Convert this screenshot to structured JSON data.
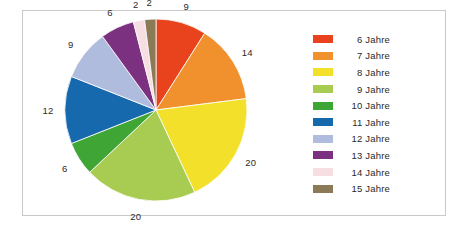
{
  "chart_data": {
    "type": "pie",
    "title": "",
    "subtitle": "",
    "xlabel": "",
    "ylabel": "",
    "legend_position": "right",
    "grid": false,
    "start_angle_deg": 0,
    "direction": "clockwise",
    "total": 100,
    "categories": [
      "6 Jahre",
      "7 Jahre",
      "8 Jahre",
      "9 Jahre",
      "10 Jahre",
      "11 Jahre",
      "12 Jahre",
      "13 Jahre",
      "14 Jahre",
      "15 Jahre"
    ],
    "values": [
      9,
      14,
      20,
      20,
      6,
      12,
      9,
      6,
      2,
      2
    ],
    "data_labels": [
      "9",
      "14",
      "20",
      "20",
      "6",
      "12",
      "9",
      "6",
      "2",
      "2"
    ],
    "colors": [
      "#E8431C",
      "#F0912E",
      "#F3E02A",
      "#A8CB52",
      "#3FA535",
      "#1769AD",
      "#AFBCDD",
      "#7B3180",
      "#F7DEE2",
      "#8B7A56"
    ]
  },
  "legend": {
    "items": [
      {
        "label": "6 Jahre",
        "color": "#E8431C"
      },
      {
        "label": "7 Jahre",
        "color": "#F0912E"
      },
      {
        "label": "8 Jahre",
        "color": "#F3E02A"
      },
      {
        "label": "9 Jahre",
        "color": "#A8CB52"
      },
      {
        "label": "10 Jahre",
        "color": "#3FA535"
      },
      {
        "label": "11 Jahre",
        "color": "#1769AD"
      },
      {
        "label": "12 Jahre",
        "color": "#AFBCDD"
      },
      {
        "label": "13 Jahre",
        "color": "#7B3180"
      },
      {
        "label": "14 Jahre",
        "color": "#F7DEE2"
      },
      {
        "label": "15 Jahre",
        "color": "#8B7A56"
      }
    ]
  }
}
